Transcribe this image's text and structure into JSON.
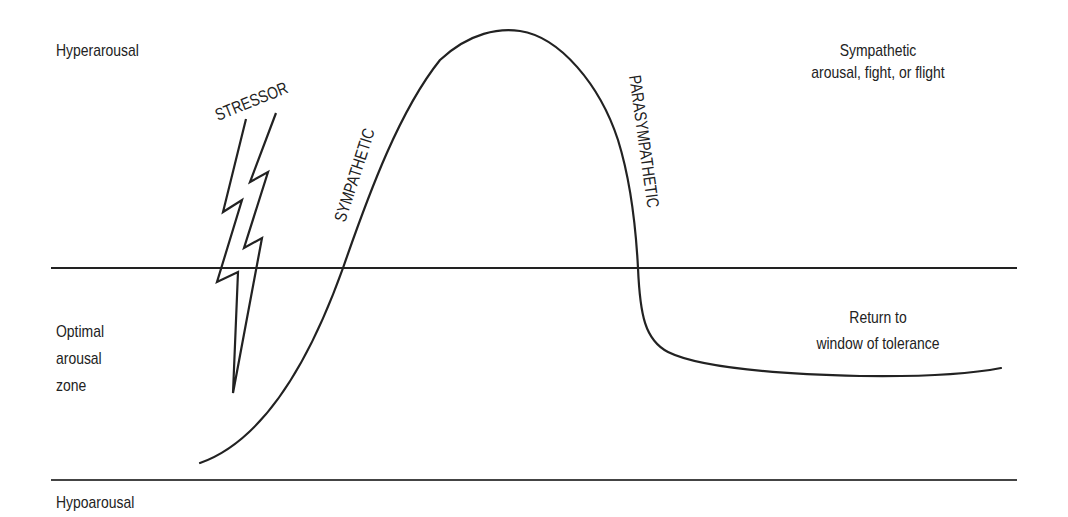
{
  "diagram": {
    "title": "Window of tolerance",
    "zones": {
      "hyper": "Hyperarousal",
      "optimal": [
        "Optimal",
        "arousal",
        "zone"
      ],
      "hypo": "Hypoarousal"
    },
    "annotations": {
      "stressor": "STRESSOR",
      "sympathetic_curve": "SYMPATHETIC",
      "parasympathetic_curve": "PARASYMPATHETIC",
      "top_right": [
        "Sympathetic",
        "arousal, fight, or flight"
      ],
      "return": [
        "Return to",
        "window of tolerance"
      ]
    },
    "colors": {
      "line": "#222222",
      "background": "#ffffff"
    },
    "boundaries": {
      "upper_threshold_y": 268,
      "lower_threshold_y": 480
    }
  }
}
